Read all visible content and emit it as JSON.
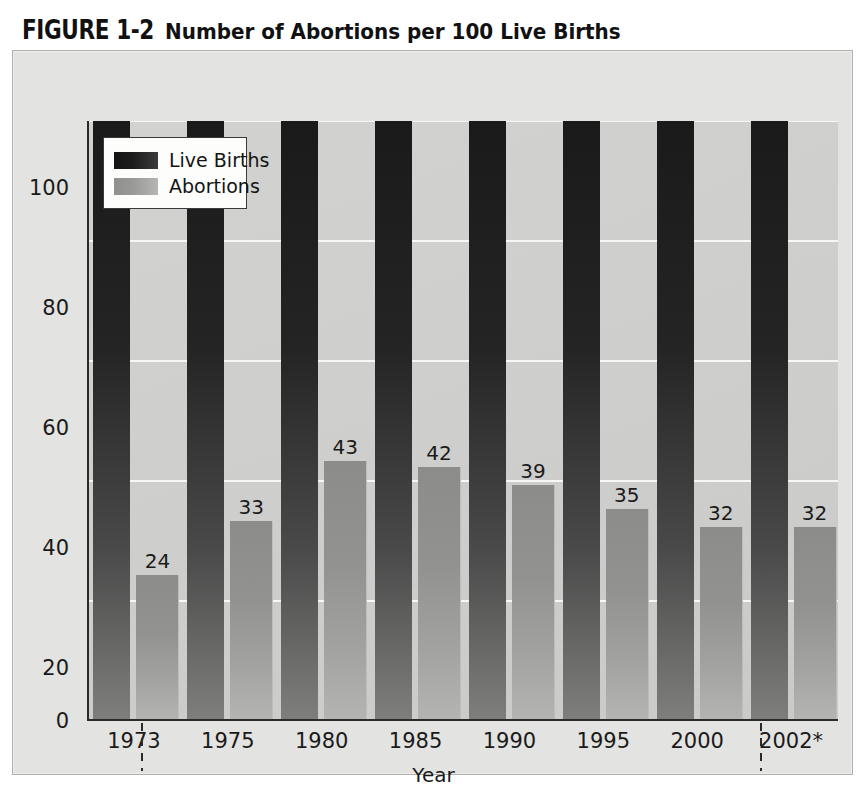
{
  "figure": {
    "number": "FIGURE 1-2",
    "title": "Number of Abortions per 100 Live Births"
  },
  "legend": {
    "position": "top-left-inside-plot",
    "items": [
      {
        "label": "Live Births",
        "swatch": "dark-gradient-swatch",
        "color": "#1a1a1a"
      },
      {
        "label": "Abortions",
        "swatch": "gray-gradient-swatch",
        "color": "#9a9a98"
      }
    ]
  },
  "axes": {
    "y_ticks": [
      "100",
      "80",
      "60",
      "40",
      "20",
      "0"
    ],
    "x_title": "Year",
    "x_ticks": [
      "1973",
      "1975",
      "1980",
      "1985",
      "1990",
      "1995",
      "2000",
      "2002*"
    ]
  },
  "chart_data": {
    "type": "bar",
    "title": "Number of Abortions per 100 Live Births",
    "xlabel": "Year",
    "ylabel": "",
    "ylim": [
      0,
      100
    ],
    "yticks": [
      0,
      20,
      40,
      60,
      80,
      100
    ],
    "grid": true,
    "legend_position": "upper left",
    "categories": [
      "1973",
      "1975",
      "1980",
      "1985",
      "1990",
      "1995",
      "2000",
      "2002*"
    ],
    "series": [
      {
        "name": "Live Births",
        "color": "#1a1a1a",
        "values": [
          100,
          100,
          100,
          100,
          100,
          100,
          100,
          100
        ],
        "data_labels": [
          "",
          "",
          "",
          "",
          "",
          "",
          "",
          ""
        ]
      },
      {
        "name": "Abortions",
        "color": "#9a9a98",
        "values": [
          24,
          33,
          43,
          42,
          39,
          35,
          32,
          32
        ],
        "data_labels": [
          "24",
          "33",
          "43",
          "42",
          "39",
          "35",
          "32",
          "32"
        ]
      }
    ],
    "annotations": [
      {
        "kind": "dashed-separator",
        "after_category": "1973"
      },
      {
        "kind": "dashed-separator",
        "after_category": "2000"
      }
    ]
  },
  "colors": {
    "page_background": "#ffffff",
    "figure_frame": "#e3e3e1",
    "plot_background": "#cfcfcd",
    "gridline": "#f7f7f5",
    "axis": "#2a2a2a",
    "text": "#1a1a1a"
  }
}
